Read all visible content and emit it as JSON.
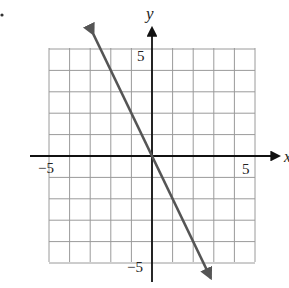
{
  "chart_data": {
    "type": "line",
    "title": "",
    "xlabel": "x",
    "ylabel": "y",
    "xlim": [
      -5,
      5
    ],
    "ylim": [
      -5,
      5
    ],
    "grid": true,
    "grid_step": 1,
    "tick_labels": {
      "x": [
        {
          "value": -5,
          "label": "−5"
        },
        {
          "value": 5,
          "label": "5"
        }
      ],
      "y": [
        {
          "value": 5,
          "label": "5"
        },
        {
          "value": -5,
          "label": "−5"
        }
      ]
    },
    "series": [
      {
        "name": "line",
        "equation": "y = -2x",
        "slope": -2,
        "intercept": 0,
        "points": [
          [
            -2.5,
            5
          ],
          [
            0,
            0
          ],
          [
            2.5,
            -5
          ]
        ],
        "arrows": "both",
        "color": "#555555"
      }
    ]
  },
  "labels": {
    "x_axis": "x",
    "y_axis": "y",
    "x_min": "−5",
    "x_max": "5",
    "y_max": "5",
    "y_min": "−5"
  },
  "marker": "•"
}
